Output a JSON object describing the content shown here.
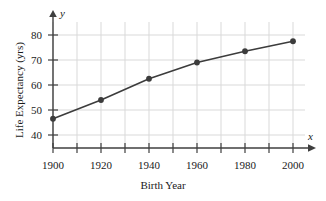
{
  "chart_data": {
    "type": "line",
    "title": "",
    "xlabel": "Birth Year",
    "ylabel": "Life Expectancy (yrs)",
    "x_var_label": "x",
    "y_var_label": "y",
    "categories": [
      1900,
      1920,
      1940,
      1960,
      1980,
      2000
    ],
    "x": [
      1900,
      1920,
      1940,
      1960,
      1980,
      2000
    ],
    "values": [
      46.5,
      54,
      62.5,
      69,
      73.5,
      77.5
    ],
    "series": [
      {
        "name": "Life Expectancy",
        "values": [
          46.5,
          54,
          62.5,
          69,
          73.5,
          77.5
        ]
      }
    ],
    "xlim": [
      1900,
      2010
    ],
    "ylim": [
      35,
      84
    ],
    "x_tick_labels": [
      "1900",
      "1920",
      "1940",
      "1960",
      "1980",
      "2000"
    ],
    "y_tick_labels": [
      "40",
      "50",
      "60",
      "70",
      "80"
    ],
    "y_ticks": [
      40,
      50,
      60,
      70,
      80
    ],
    "x_minor_step": 10,
    "y_minor_step": 10,
    "grid": true,
    "legend": "none",
    "marker": "circle",
    "colors": {
      "line": "#3c3c3c",
      "marker": "#3c3c3c",
      "grid": "#d6d6d6",
      "axis": "#444444",
      "text": "#1a1a1a",
      "background": "#ffffff"
    }
  }
}
